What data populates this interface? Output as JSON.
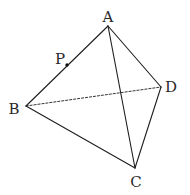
{
  "figure": {
    "type": "tetrahedron",
    "vertices": [
      {
        "id": "A",
        "label": "A",
        "x": 108,
        "y": 26,
        "label_x": 108,
        "label_y": 22
      },
      {
        "id": "B",
        "label": "B",
        "x": 26,
        "y": 106,
        "label_x": 14,
        "label_y": 114
      },
      {
        "id": "C",
        "label": "C",
        "x": 135,
        "y": 168,
        "label_x": 136,
        "label_y": 187
      },
      {
        "id": "D",
        "label": "D",
        "x": 161,
        "y": 87,
        "label_x": 171,
        "label_y": 92
      }
    ],
    "point_on_edge": {
      "id": "P",
      "label": "P",
      "edge": "AB",
      "x": 67,
      "y": 65,
      "label_x": 60,
      "label_y": 64
    },
    "edges": [
      {
        "from": "A",
        "to": "B",
        "style": "solid"
      },
      {
        "from": "A",
        "to": "C",
        "style": "solid"
      },
      {
        "from": "A",
        "to": "D",
        "style": "solid"
      },
      {
        "from": "B",
        "to": "C",
        "style": "solid"
      },
      {
        "from": "C",
        "to": "D",
        "style": "solid"
      },
      {
        "from": "B",
        "to": "D",
        "style": "dashed"
      }
    ]
  },
  "labels": {
    "A": "A",
    "B": "B",
    "C": "C",
    "D": "D",
    "P": "P"
  }
}
